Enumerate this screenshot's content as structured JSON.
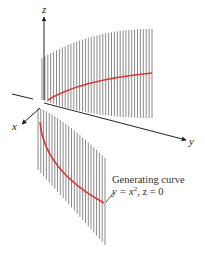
{
  "figure": {
    "axes": {
      "x_label": "x",
      "y_label": "y",
      "z_label": "z"
    },
    "annotation": {
      "title": "Generating curve",
      "equation_lhs": "y = x",
      "equation_exp": "2",
      "equation_rest": ", z = 0"
    },
    "colors": {
      "ruling_lines": "#8a8a8a",
      "generating_curve": "#d9383a",
      "axes": "#222222",
      "background": "#ffffff"
    }
  }
}
